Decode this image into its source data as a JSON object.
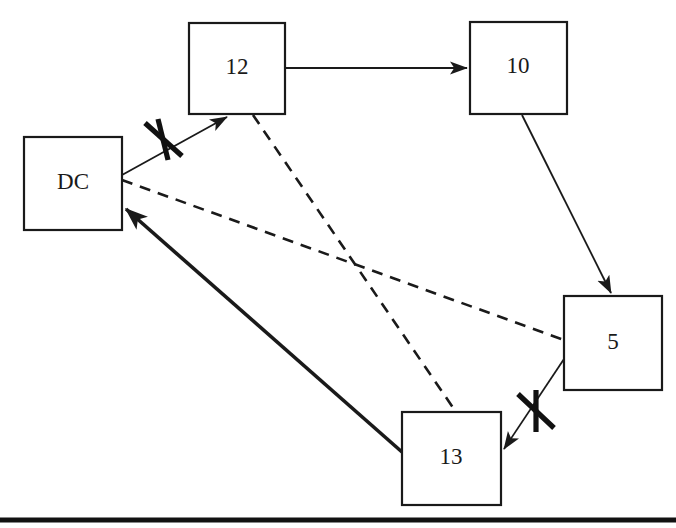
{
  "diagram": {
    "canvas": {
      "width": 676,
      "height": 528,
      "background": "#ffffff"
    },
    "stroke_color": "#1a1a1a",
    "nodes": [
      {
        "id": "DC",
        "label": "DC",
        "x": 24,
        "y": 137,
        "w": 98,
        "h": 93
      },
      {
        "id": "12",
        "label": "12",
        "x": 189,
        "y": 23,
        "w": 96,
        "h": 91
      },
      {
        "id": "10",
        "label": "10",
        "x": 470,
        "y": 22,
        "w": 97,
        "h": 92
      },
      {
        "id": "5",
        "label": "5",
        "x": 564,
        "y": 296,
        "w": 98,
        "h": 94
      },
      {
        "id": "13",
        "label": "13",
        "x": 402,
        "y": 412,
        "w": 99,
        "h": 93
      }
    ],
    "edges": [
      {
        "id": "dc-to-12",
        "from": "DC",
        "to": "12",
        "style": "solid-thin",
        "arrow": true,
        "blocked": true,
        "x1": 122,
        "y1": 175,
        "x2": 227,
        "y2": 116
      },
      {
        "id": "12-to-10",
        "from": "12",
        "to": "10",
        "style": "solid-thin",
        "arrow": true,
        "blocked": false,
        "x1": 285,
        "y1": 68,
        "x2": 468,
        "y2": 68
      },
      {
        "id": "10-to-5",
        "from": "10",
        "to": "5",
        "style": "solid-thin",
        "arrow": true,
        "blocked": false,
        "x1": 522,
        "y1": 115,
        "x2": 612,
        "y2": 294
      },
      {
        "id": "5-to-13",
        "from": "5",
        "to": "13",
        "style": "solid-thin",
        "arrow": true,
        "blocked": true,
        "x1": 566,
        "y1": 356,
        "x2": 503,
        "y2": 450
      },
      {
        "id": "13-to-dc",
        "from": "13",
        "to": "DC",
        "style": "solid-thick",
        "arrow": true,
        "blocked": false,
        "x1": 402,
        "y1": 452,
        "x2": 124,
        "y2": 207
      },
      {
        "id": "dc-to-5-dashed",
        "from": "DC",
        "to": "5",
        "style": "dashed",
        "arrow": false,
        "blocked": false,
        "x1": 122,
        "y1": 180,
        "x2": 564,
        "y2": 340
      },
      {
        "id": "12-to-13-dashed",
        "from": "12",
        "to": "13",
        "style": "dashed",
        "arrow": false,
        "blocked": false,
        "x1": 253,
        "y1": 115,
        "x2": 456,
        "y2": 412
      }
    ],
    "blocked_markers": [
      {
        "id": "cross-dc-12",
        "cx": 163,
        "cy": 139
      },
      {
        "id": "cross-5-13",
        "cx": 535,
        "cy": 411
      }
    ],
    "baseline_rule": {
      "x1": 0,
      "y1": 520,
      "x2": 676,
      "y2": 520
    }
  }
}
